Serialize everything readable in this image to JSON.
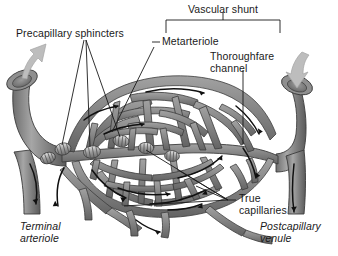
{
  "figure": {
    "background_color": "#ffffff",
    "vessel_fill_light": "#9a9a9a",
    "vessel_fill_mid": "#7d7d7d",
    "vessel_fill_dark": "#5e5e5e",
    "vessel_outline": "#3a3a3a",
    "arrow_dark": "#101010",
    "arrow_gray": "#b6b6b6",
    "label_color": "#1a1a1a"
  },
  "labels": {
    "vascular_shunt": "Vascular shunt",
    "precapillary_sphincters": "Precapillary sphincters",
    "metarteriole": "Metarteriole",
    "thoroughfare_channel": "Thoroughfare\nchannel",
    "true_capillaries": "True\ncapillaries",
    "terminal_arteriole": "Terminal\narteriole",
    "postcapillary_venule": "Postcapillary\nvenule"
  },
  "structures": {
    "terminal_arteriole": {
      "name": "Terminal arteriole",
      "side": "left",
      "flow_direction": "inflow",
      "arrow_color": "#b6b6b6",
      "cut_lumen": true
    },
    "postcapillary_venule": {
      "name": "Postcapillary venule",
      "side": "right",
      "flow_direction": "outflow",
      "arrow_color": "#b6b6b6",
      "cut_lumen": true
    },
    "metarteriole": {
      "name": "Metarteriole",
      "description": "Proximal portion of the central channel leaving the terminal arteriole"
    },
    "thoroughfare_channel": {
      "name": "Thoroughfare channel",
      "description": "Distal portion of the central channel draining into the postcapillary venule"
    },
    "vascular_shunt": {
      "name": "Vascular shunt",
      "components": [
        "Metarteriole",
        "Thoroughfare channel"
      ],
      "bracket": true
    },
    "precapillary_sphincters": {
      "name": "Precapillary sphincters",
      "count_drawn": 5,
      "description": "Banded smooth-muscle rings at the origins of true capillaries"
    },
    "true_capillaries": {
      "name": "True capillaries",
      "description": "Anastomosing meshwork between the metarteriole and the thoroughfare channel"
    }
  },
  "flow_arrows": {
    "color": "#101010",
    "count": 14,
    "description": "Curved arrows inside vessels indicating blood flow left to right"
  }
}
